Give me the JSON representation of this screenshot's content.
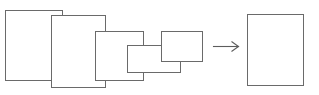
{
  "diagram": {
    "canvas": {
      "width": 319,
      "height": 95,
      "background": "#ffffff"
    },
    "stroke_color": "#6a6a6a",
    "fill_color": "#ffffff",
    "stroke_width": 1,
    "source_group": {
      "name": "overlapping-rectangles",
      "count": 5,
      "rectangles": [
        {
          "id": "rect-1",
          "label": "",
          "x": 5,
          "y": 10,
          "width": 57,
          "height": 70
        },
        {
          "id": "rect-2",
          "label": "",
          "x": 51,
          "y": 15,
          "width": 54,
          "height": 72
        },
        {
          "id": "rect-3",
          "label": "",
          "x": 95,
          "y": 31,
          "width": 48,
          "height": 49
        },
        {
          "id": "rect-4",
          "label": "",
          "x": 127,
          "y": 45,
          "width": 53,
          "height": 27
        },
        {
          "id": "rect-5",
          "label": "",
          "x": 161,
          "y": 31,
          "width": 41,
          "height": 30
        }
      ]
    },
    "arrow": {
      "name": "rightward-arrow",
      "label": "",
      "direction": "right",
      "x1": 213,
      "y1": 46,
      "x2": 238,
      "y2": 46,
      "head_length": 7,
      "head_spread": 5,
      "color": "#5d5d5d"
    },
    "result_group": {
      "name": "result-rectangle",
      "count": 1,
      "rectangles": [
        {
          "id": "rect-result",
          "label": "",
          "x": 247,
          "y": 14,
          "width": 56,
          "height": 71
        }
      ]
    }
  }
}
